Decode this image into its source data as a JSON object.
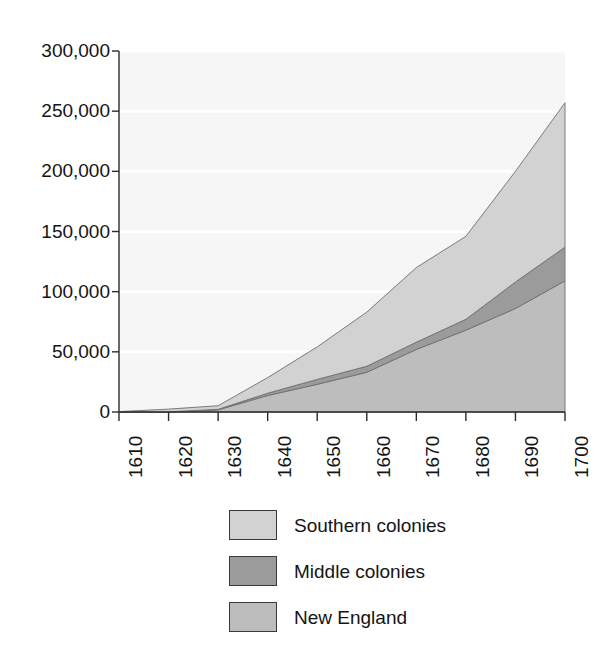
{
  "chart_data": {
    "type": "area",
    "stacked": true,
    "title": "",
    "subtitle": "",
    "xlabel": "",
    "ylabel": "",
    "x": [
      1610,
      1620,
      1630,
      1640,
      1650,
      1660,
      1670,
      1680,
      1690,
      1700
    ],
    "categories": [
      "1610",
      "1620",
      "1630",
      "1640",
      "1650",
      "1660",
      "1670",
      "1680",
      "1690",
      "1700"
    ],
    "series": [
      {
        "name": "New England",
        "color": "#bdbdbd",
        "values": [
          0,
          100,
          1800,
          13700,
          23000,
          33000,
          52000,
          68000,
          86000,
          109000
        ]
      },
      {
        "name": "Middle colonies",
        "color": "#9b9b9b",
        "values": [
          0,
          0,
          400,
          1900,
          4100,
          5000,
          6000,
          9000,
          22000,
          28000
        ]
      },
      {
        "name": "Southern colonies",
        "color": "#d2d2d2",
        "values": [
          350,
          2300,
          3000,
          13000,
          27000,
          45000,
          62000,
          69000,
          92000,
          120000
        ]
      }
    ],
    "stack_order": [
      "New England",
      "Middle colonies",
      "Southern colonies"
    ],
    "stack_totals": [
      350,
      2400,
      5200,
      28600,
      54100,
      83000,
      120000,
      146000,
      200000,
      257000
    ],
    "ylim": [
      0,
      300000
    ],
    "yticks": [
      0,
      50000,
      100000,
      150000,
      200000,
      250000,
      300000
    ],
    "ytick_labels": [
      "0",
      "50,000",
      "100,000",
      "150,000",
      "200,000",
      "250,000",
      "300,000"
    ],
    "xlim": [
      1610,
      1700
    ],
    "xticks": [
      1610,
      1620,
      1630,
      1640,
      1650,
      1660,
      1670,
      1680,
      1690,
      1700
    ],
    "grid": true,
    "grid_color": "#ffffff",
    "plot_background": "#f6f6f6",
    "axis_color": "#2b2b2b",
    "legend_position": "bottom-center"
  },
  "legend": {
    "entries": [
      {
        "label": "Southern colonies",
        "color": "#d2d2d2"
      },
      {
        "label": "Middle colonies",
        "color": "#9b9b9b"
      },
      {
        "label": "New England",
        "color": "#bdbdbd"
      }
    ]
  },
  "axis": {
    "y_labels": [
      "300,000",
      "250,000",
      "200,000",
      "150,000",
      "100,000",
      "50,000",
      "0"
    ],
    "x_labels": [
      "1610",
      "1620",
      "1630",
      "1640",
      "1650",
      "1660",
      "1670",
      "1680",
      "1690",
      "1700"
    ]
  }
}
